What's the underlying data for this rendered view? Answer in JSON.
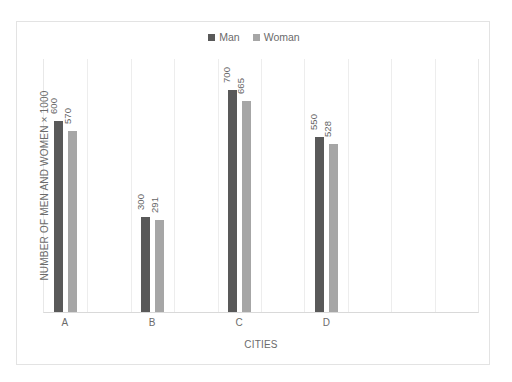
{
  "chart_data": {
    "type": "bar",
    "title": "",
    "subtitle": "",
    "xlabel": "CITIES",
    "ylabel": "NUMBER OF MEN AND WOMEN × 1000",
    "categories": [
      "A",
      "B",
      "C",
      "D"
    ],
    "series": [
      {
        "name": "Man",
        "color": "#595959",
        "values": [
          600,
          300,
          700,
          550
        ]
      },
      {
        "name": "Woman",
        "color": "#a6a6a6",
        "values": [
          570,
          291,
          665,
          528
        ]
      }
    ],
    "data_labels": [
      [
        "600",
        "570"
      ],
      [
        "300",
        "291"
      ],
      [
        "700",
        "665"
      ],
      [
        "550",
        "528"
      ]
    ],
    "ylim": [
      0,
      800
    ],
    "grid": {
      "vertical": true,
      "horizontal": false
    },
    "axis_ticks_visible": false,
    "legend": {
      "position": "top-center",
      "entries": [
        "Man",
        "Woman"
      ]
    },
    "data_label_rotation": -90,
    "value_suffix_note": "values are in thousands"
  },
  "legend": {
    "items": [
      {
        "label": "Man",
        "color": "#595959"
      },
      {
        "label": "Woman",
        "color": "#a6a6a6"
      }
    ]
  },
  "axes": {
    "x_title": "CITIES",
    "y_title": "NUMBER OF MEN AND WOMEN × 1000",
    "x_tick_labels": [
      "A",
      "B",
      "C",
      "D"
    ]
  },
  "colors": {
    "man_bar": "#595959",
    "woman_bar": "#a6a6a6",
    "gridline": "#ededed",
    "frame_border": "#e3e3e3",
    "axis_line": "#d9d9d9",
    "text": "#6b6b6b",
    "background": "#ffffff"
  }
}
